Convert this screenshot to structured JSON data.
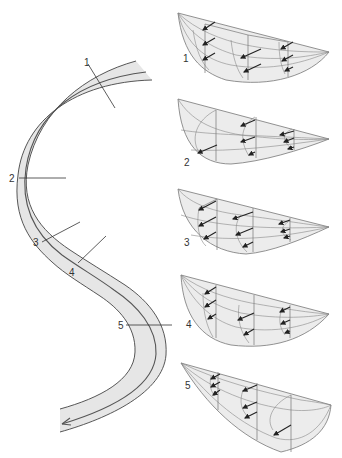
{
  "figure": {
    "type": "meandering channel flow velocity block diagrams",
    "colors": {
      "channel_fill": "#e6e6e6",
      "block_fill": "#ececec",
      "line": "#444444",
      "arrow": "#222222",
      "background": "#ffffff"
    }
  },
  "channel": {
    "sections": [
      {
        "label": "1"
      },
      {
        "label": "2"
      },
      {
        "label": "3"
      },
      {
        "label": "4"
      },
      {
        "label": "5"
      }
    ],
    "flow_arrow": "arrow-icon"
  },
  "blocks": [
    {
      "label": "1",
      "shape": "deepest near left bank"
    },
    {
      "label": "2",
      "shape": "deepest on left, apex right"
    },
    {
      "label": "3",
      "shape": "deepest on left, apex right"
    },
    {
      "label": "4",
      "shape": "deepest near left, symmetric-ish"
    },
    {
      "label": "5",
      "shape": "apex left, deepest on right"
    }
  ]
}
